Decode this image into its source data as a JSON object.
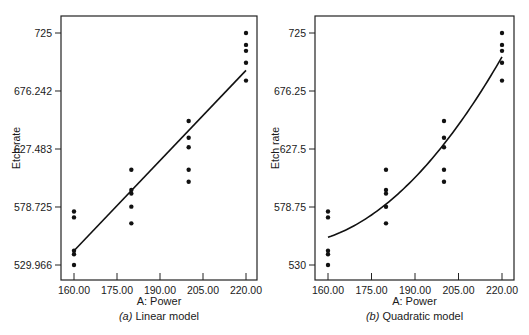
{
  "chart_data": [
    {
      "type": "scatter",
      "title": "(a) Linear model",
      "caption_prefix": "(a)",
      "caption_text": "Linear model",
      "xlabel": "A: Power",
      "ylabel": "Etch rate",
      "x_ticks": [
        "160.00",
        "175.00",
        "190.00",
        "205.00",
        "220.00"
      ],
      "x_tick_values": [
        160,
        175,
        190,
        205,
        220
      ],
      "y_ticks": [
        "529.966",
        "578.725",
        "627.483",
        "676.242",
        "725"
      ],
      "y_tick_values": [
        529.966,
        578.725,
        627.483,
        676.242,
        725
      ],
      "xlim": [
        155,
        225
      ],
      "ylim": [
        512,
        744
      ],
      "grid": false,
      "points": {
        "x": [
          160,
          160,
          160,
          160,
          160,
          180,
          180,
          180,
          180,
          180,
          200,
          200,
          200,
          200,
          200,
          220,
          220,
          220,
          220,
          220
        ],
        "y": [
          575,
          542,
          530,
          539,
          570,
          565,
          593,
          590,
          579,
          610,
          600,
          651,
          610,
          637,
          629,
          725,
          700,
          715,
          685,
          710
        ]
      },
      "fit_line": {
        "model": "linear",
        "x": [
          160,
          220
        ],
        "y": [
          541.9,
          693.6
        ]
      }
    },
    {
      "type": "scatter",
      "title": "(b) Quadratic model",
      "caption_prefix": "(b)",
      "caption_text": "Quadratic model",
      "xlabel": "A: Power",
      "ylabel": "Etch rate",
      "x_ticks": [
        "160.00",
        "175.00",
        "190.00",
        "205.00",
        "220.00"
      ],
      "x_tick_values": [
        160,
        175,
        190,
        205,
        220
      ],
      "y_ticks": [
        "530",
        "578.75",
        "627.5",
        "676.25",
        "725"
      ],
      "y_tick_values": [
        530,
        578.75,
        627.5,
        676.25,
        725
      ],
      "xlim": [
        155,
        225
      ],
      "ylim": [
        512,
        744
      ],
      "grid": false,
      "points": {
        "x": [
          160,
          160,
          160,
          160,
          160,
          180,
          180,
          180,
          180,
          180,
          200,
          200,
          200,
          200,
          200,
          220,
          220,
          220,
          220,
          220
        ],
        "y": [
          575,
          542,
          530,
          539,
          570,
          565,
          593,
          590,
          579,
          610,
          600,
          651,
          610,
          637,
          629,
          725,
          700,
          715,
          685,
          710
        ]
      },
      "fit_curve": {
        "model": "quadratic",
        "x": [
          160,
          180,
          200,
          220
        ],
        "y": [
          553.3,
          581.1,
          631.7,
          704.9
        ]
      }
    }
  ],
  "panels": [
    {
      "xlabel": "A: Power",
      "ylabel": "Etch rate",
      "caption_prefix": "(a)",
      "caption_text": "Linear model"
    },
    {
      "xlabel": "A: Power",
      "ylabel": "Etch rate",
      "caption_prefix": "(b)",
      "caption_text": "Quadratic model"
    }
  ]
}
